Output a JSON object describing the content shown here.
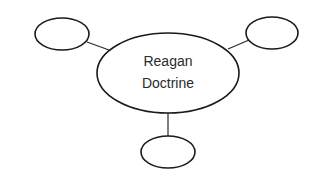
{
  "diagram": {
    "type": "concept-web",
    "center": {
      "lines": [
        "Reagan",
        "Doctrine"
      ]
    },
    "satellites": [
      {
        "position": "upper-left",
        "text": ""
      },
      {
        "position": "upper-right",
        "text": ""
      },
      {
        "position": "bottom",
        "text": ""
      }
    ],
    "colors": {
      "stroke": "#1a1a1a",
      "background": "#ffffff",
      "text": "#2b2b2b"
    }
  }
}
